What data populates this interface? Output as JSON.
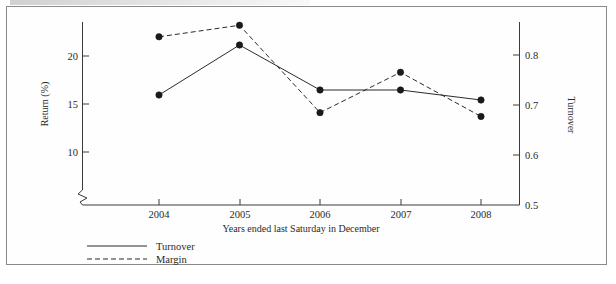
{
  "chart_data": {
    "type": "line",
    "title": "",
    "xlabel": "Years ended last Saturday in December",
    "categories": [
      "2004",
      "2005",
      "2006",
      "2007",
      "2008"
    ],
    "grid": false,
    "legend_position": "bottom-left",
    "axes": {
      "left": {
        "label": "Return (%)",
        "ticks": [
          "10",
          "15",
          "20"
        ],
        "tick_values": [
          10,
          15,
          20
        ],
        "range": [
          10,
          20
        ],
        "axis_break": true
      },
      "right": {
        "label": "Turnover",
        "ticks": [
          "0.5",
          "0.6",
          "0.7",
          "0.8"
        ],
        "tick_values": [
          0.5,
          0.6,
          0.7,
          0.8
        ],
        "range": [
          0.5,
          0.8
        ]
      }
    },
    "series": [
      {
        "name": "Turnover",
        "style": "solid",
        "axis": "right",
        "values": [
          0.72,
          0.82,
          0.73,
          0.73,
          0.71
        ]
      },
      {
        "name": "Margin",
        "style": "dashed",
        "axis": "left",
        "values": [
          22.0,
          23.2,
          14.1,
          18.3,
          13.7
        ]
      }
    ]
  },
  "legend": {
    "items": [
      {
        "label": "Turnover",
        "style": "solid"
      },
      {
        "label": "Margin",
        "style": "dashed"
      }
    ]
  },
  "labels": {
    "left_axis_title": "Return (%)",
    "right_axis_title": "Turnover",
    "x_axis_title": "Years ended last Saturday in December"
  }
}
